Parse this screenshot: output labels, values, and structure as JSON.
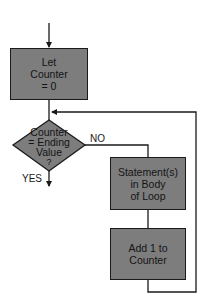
{
  "diagram": {
    "type": "flowchart",
    "colors": {
      "node_fill": "#7d7d7d",
      "line": "#1a1a1a",
      "background": "#ffffff"
    },
    "nodes": {
      "init": {
        "shape": "rectangle",
        "lines": [
          "Let",
          "Counter",
          "= 0"
        ]
      },
      "decision": {
        "shape": "diamond",
        "lines": [
          "Counter",
          "= Ending",
          "Value",
          "?"
        ]
      },
      "body": {
        "shape": "rectangle",
        "lines": [
          "Statement(s)",
          "in Body",
          "of Loop"
        ]
      },
      "increment": {
        "shape": "rectangle",
        "lines": [
          "Add 1 to",
          "Counter"
        ]
      }
    },
    "edges": {
      "no_label": "NO",
      "yes_label": "YES"
    },
    "connections": [
      {
        "from": "start",
        "to": "init"
      },
      {
        "from": "init",
        "to": "decision"
      },
      {
        "from": "decision",
        "to": "body",
        "label": "NO"
      },
      {
        "from": "decision",
        "to": "exit",
        "label": "YES"
      },
      {
        "from": "body",
        "to": "increment"
      },
      {
        "from": "increment",
        "to": "decision",
        "note": "loop back"
      }
    ]
  }
}
